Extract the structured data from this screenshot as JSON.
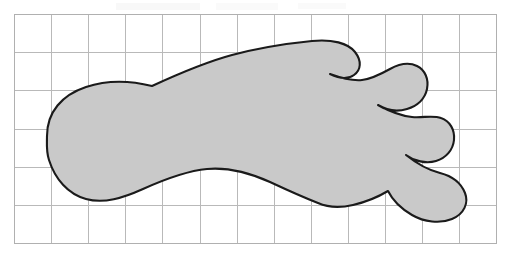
{
  "figure": {
    "background_color": "#ffffff"
  },
  "grid": {
    "name": "square-grid",
    "origin_x": 14,
    "origin_y": 14,
    "columns": 13,
    "rows": 6,
    "cell_width": 37.1,
    "cell_height": 38.2,
    "total_width": 482,
    "total_height": 229,
    "line_color": "#b9b9b9",
    "border_color": "#b0b0b0",
    "line_width": 1
  },
  "shape": {
    "name": "foot",
    "fill_color": "#c9c9c9",
    "stroke_color": "#1a1a1a",
    "stroke_width": 2.1,
    "toe_count": 5,
    "orientation": "heel-left-toes-right",
    "bounds": {
      "left": 47,
      "right": 467,
      "top": 41,
      "bottom": 207
    },
    "path": "M 47,136 C 47,112 62,95 86,87 C 113,78 140,83 152,86 C 178,74 206,62 232,55 C 262,47 292,43 312,41 C 332,39 348,43 355,52 C 362,61 361,70 354,75 C 347,80 338,78 330,74 L 330,74 C 341,78 352,81 362,80 C 372,79 381,74 390,69 C 399,64 409,62 417,66 C 425,70 429,79 427,89 C 425,99 417,106 407,109 C 397,112 386,110 378,105 L 378,105 C 389,111 401,116 412,117 C 423,118 433,115 441,118 C 450,121 455,130 454,140 C 453,150 446,158 436,161 C 426,164 414,161 406,155 L 406,155 C 416,163 428,170 440,173 C 452,176 461,183 465,193 C 469,203 464,214 452,219 C 440,224 424,222 412,215 C 400,208 392,199 388,191 C 378,197 366,202 353,205 C 340,208 327,207 318,203 C 300,196 285,189 270,182 C 250,173 229,167 207,169 C 185,171 163,180 143,189 C 123,198 104,204 86,199 C 68,194 55,179 49,160 C 46,151 47,143 47,136 Z"
  }
}
